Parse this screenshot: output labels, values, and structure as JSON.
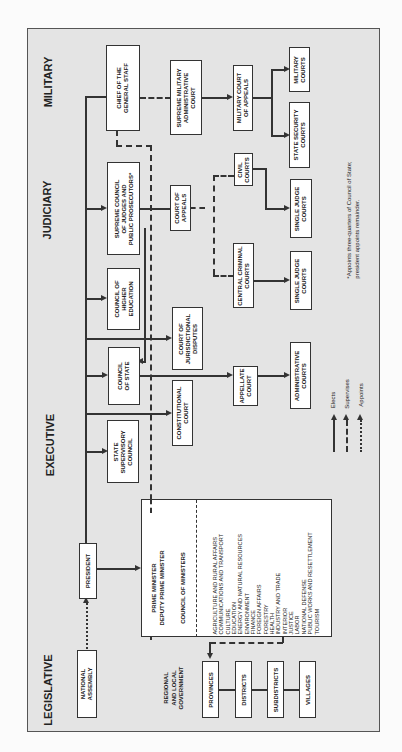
{
  "sections": {
    "legislative": "LEGISLATIVE",
    "executive": "EXECUTIVE",
    "judiciary": "JUDICIARY",
    "military": "MILITARY"
  },
  "regional_label": "REGIONAL\nAND LOCAL\nGOVERNMENT",
  "nodes": {
    "national_assembly": "NATIONAL\nASSEMBLY",
    "president": "PRESIDENT",
    "state_supervisory_council": "STATE\nSUPERVISORY\nCOUNCIL",
    "council_of_state": "COUNCIL\nOF STATE",
    "council_of_higher_education": "COUNCIL OF\nHIGHER\nEDUCATION",
    "supreme_council_judges": "SUPREME COUNCIL\nOF JUDGES AND\nPUBLIC PROSECUTORS*",
    "chief_general_staff": "CHIEF OF THE\nGENERAL STAFF",
    "constitutional_court": "CONSTITUTIONAL\nCOURT",
    "court_jurisdictional_disputes": "COURT OF\nJURISDICTIONAL\nDISPUTES",
    "court_of_appeals": "COURT OF\nAPPEALS",
    "supreme_military_admin_court": "SUPREME MILITARY\nADMINISTRATIVE\nCOURT",
    "appellate_court": "APPELLATE\nCOURT",
    "central_criminal_courts": "CENTRAL CRIMINAL\nCOURTS",
    "civil_courts": "CIVIL\nCOURTS",
    "military_court_of_appeals": "MILITARY COURT\nOF APPEALS",
    "administrative_courts": "ADMINISTRATIVE\nCOURTS",
    "single_judge_courts_criminal": "SINGLE JUDGE\nCOURTS",
    "single_judge_courts_civil": "SINGLE JUDGE\nCOURTS",
    "state_security_courts": "STATE SECURITY\nCOURTS",
    "military_courts": "MILITARY\nCOURTS",
    "provinces": "PROVINCES",
    "districts": "DISTRICTS",
    "subdistricts": "SUBDISTRICTS",
    "villages": "VILLAGES"
  },
  "council_of_ministers": {
    "header": "PRIME MINISTER\nDEPUTY PRIME MINISTER",
    "title": "COUNCIL OF MINISTERS",
    "ministries": [
      "AGRICULTURE AND RURAL AFFAIRS",
      "COMMUNICATIONS AND TRANSPORT",
      "CULTURE",
      "EDUCATION",
      "ENERGY AND NATURAL RESOURCES",
      "ENVIRONMENT",
      "FINANCE",
      "FOREIGN AFFAIRS",
      "FORESTRY",
      "HEALTH",
      "INDUSTRY AND TRADE",
      "INTERIOR",
      "JUSTICE",
      "LABOR",
      "NATIONAL DEFENSE",
      "PUBLIC WORKS AND RESETTLEMENT",
      "TOURISM"
    ]
  },
  "legend": {
    "elects": "Elects",
    "supervises": "Supervises",
    "appoints": "Appoints"
  },
  "footnote": "*Appoints three-quarters of Council of State;\npresident appoints remainder."
}
